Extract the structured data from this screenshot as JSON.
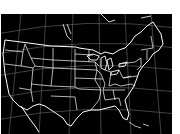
{
  "map": {
    "title": "",
    "region": "contiguous-united-states",
    "background_color": "#000000",
    "boundary_color": "#ffffff",
    "graticule_color": "#8a8a8a",
    "page_background": "#ffffff",
    "layers": [
      "graticule",
      "state-boundaries",
      "coastlines",
      "great-lakes"
    ]
  }
}
